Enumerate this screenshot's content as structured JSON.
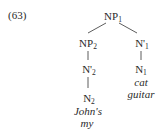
{
  "example": {
    "number": "(63)"
  },
  "tree": {
    "root": {
      "label": "NP",
      "sub": "1"
    },
    "left": {
      "label": "NP",
      "sub": "2",
      "child": {
        "label": "N'",
        "sub": "2",
        "child": {
          "label": "N",
          "sub": "2",
          "words": [
            "John's",
            "my"
          ]
        }
      }
    },
    "right": {
      "label": "N'",
      "sub": "1",
      "child": {
        "label": "N",
        "sub": "1",
        "words": [
          "cat",
          "guitar"
        ]
      }
    }
  }
}
